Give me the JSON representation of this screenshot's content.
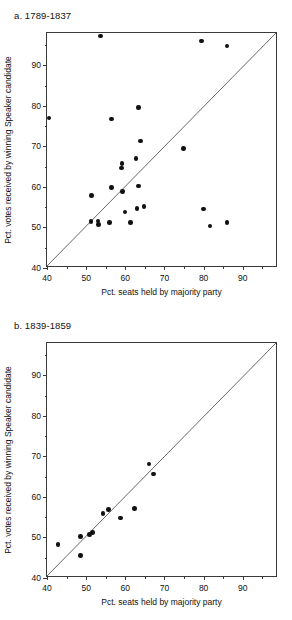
{
  "figure": {
    "panels": [
      {
        "id": "a",
        "title": "a. 1789-1837",
        "xlabel": "Pct. seats held by majority party",
        "ylabel": "Pct. votes received by winning Speaker candidate"
      },
      {
        "id": "b",
        "title": "b.  1839-1859",
        "xlabel": "Pct. seats held by majority party",
        "ylabel": "Pct. votes received by winning Speaker candidate"
      }
    ]
  },
  "axis": {
    "xticks": [
      40,
      50,
      60,
      70,
      80,
      90
    ],
    "yticks": [
      40,
      50,
      60,
      70,
      80,
      90
    ],
    "xminor": [
      45,
      55,
      65,
      75,
      85,
      95
    ],
    "yminor": [
      45,
      55,
      65,
      75,
      85,
      95
    ],
    "xlim": [
      40,
      99
    ],
    "ylim": [
      40,
      98
    ]
  },
  "colors": {
    "marker": "#111111",
    "axis": "#3a3a3a",
    "reference_line": "#555555",
    "background": "#ffffff"
  },
  "chart_data": [
    {
      "type": "scatter",
      "title": "a. 1789-1837",
      "xlabel": "Pct. seats held by majority party",
      "ylabel": "Pct. votes received by winning Speaker candidate",
      "xlim": [
        40,
        99
      ],
      "ylim": [
        40,
        98
      ],
      "grid": false,
      "legend": null,
      "annotations": [
        "45-degree reference line from (40,40) to (99,98)"
      ],
      "series": [
        {
          "name": "1789-1837 Speaker elections",
          "points": [
            [
              40.5,
              77.0
            ],
            [
              53.6,
              97.3
            ],
            [
              79.5,
              96.0
            ],
            [
              86.0,
              94.8
            ],
            [
              63.3,
              79.6
            ],
            [
              56.4,
              76.8
            ],
            [
              63.9,
              71.3
            ],
            [
              74.8,
              69.5
            ],
            [
              62.7,
              67.0
            ],
            [
              59.2,
              65.8
            ],
            [
              59.0,
              64.7
            ],
            [
              56.4,
              59.8
            ],
            [
              63.4,
              60.2
            ],
            [
              59.3,
              58.9
            ],
            [
              51.4,
              57.9
            ],
            [
              64.8,
              55.2
            ],
            [
              63.0,
              54.7
            ],
            [
              79.9,
              54.6
            ],
            [
              59.9,
              53.8
            ],
            [
              51.2,
              51.5
            ],
            [
              53.0,
              51.6
            ],
            [
              53.1,
              50.7
            ],
            [
              56.0,
              51.2
            ],
            [
              61.3,
              51.2
            ],
            [
              86.0,
              51.3
            ],
            [
              81.6,
              50.4
            ]
          ]
        }
      ]
    },
    {
      "type": "scatter",
      "title": "b.  1839-1859",
      "xlabel": "Pct. seats held by majority party",
      "ylabel": "Pct. votes received by winning Speaker candidate",
      "xlim": [
        40,
        99
      ],
      "ylim": [
        40,
        98
      ],
      "grid": false,
      "legend": null,
      "annotations": [
        "45-degree reference line from (40,40) to (99,98)"
      ],
      "series": [
        {
          "name": "1839-1859 Speaker elections",
          "points": [
            [
              42.8,
              48.2
            ],
            [
              48.5,
              45.6
            ],
            [
              48.6,
              50.3
            ],
            [
              50.8,
              50.8
            ],
            [
              51.6,
              51.3
            ],
            [
              54.3,
              55.9
            ],
            [
              55.7,
              56.9
            ],
            [
              58.7,
              54.8
            ],
            [
              62.3,
              57.1
            ],
            [
              66.1,
              68.1
            ],
            [
              67.2,
              65.7
            ]
          ]
        }
      ]
    }
  ]
}
